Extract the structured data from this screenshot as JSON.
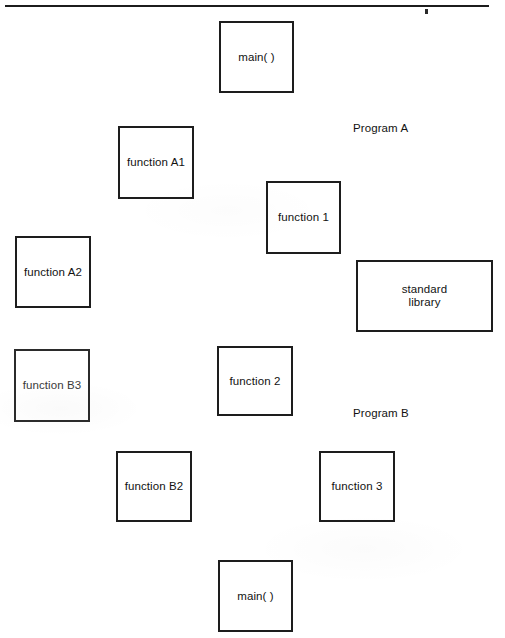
{
  "page": {
    "background_color": "#ffffff",
    "line_color": "#1d1d1d",
    "text_color": "#121212",
    "width": 505,
    "height": 638
  },
  "divider": {
    "name": "top-horizontal-rule"
  },
  "diagram": {
    "type": "diagram",
    "group_labels": [
      {
        "text": "Program A",
        "x": 353,
        "y": 121
      },
      {
        "text": "Program B",
        "x": 353,
        "y": 406
      }
    ],
    "nodes": [
      {
        "id": "main-top",
        "label": "main( )",
        "x": 219,
        "y": 21,
        "w": 75,
        "h": 72
      },
      {
        "id": "function-a1",
        "label": "function A1",
        "x": 118,
        "y": 126,
        "w": 76,
        "h": 73
      },
      {
        "id": "function-1",
        "label": "function 1",
        "x": 266,
        "y": 181,
        "w": 75,
        "h": 73
      },
      {
        "id": "function-a2",
        "label": "function A2",
        "x": 15,
        "y": 236,
        "w": 76,
        "h": 72
      },
      {
        "id": "standard-library",
        "label": "standard\nlibrary",
        "x": 356,
        "y": 260,
        "w": 137,
        "h": 72
      },
      {
        "id": "function-b3",
        "label": "function B3",
        "x": 14,
        "y": 349,
        "w": 76,
        "h": 73
      },
      {
        "id": "function-2",
        "label": "function 2",
        "x": 217,
        "y": 346,
        "w": 76,
        "h": 70
      },
      {
        "id": "function-b2",
        "label": "function B2",
        "x": 116,
        "y": 451,
        "w": 76,
        "h": 71
      },
      {
        "id": "function-3",
        "label": "function 3",
        "x": 319,
        "y": 451,
        "w": 76,
        "h": 71
      },
      {
        "id": "main-bottom",
        "label": "main( )",
        "x": 218,
        "y": 560,
        "w": 75,
        "h": 72
      }
    ]
  }
}
